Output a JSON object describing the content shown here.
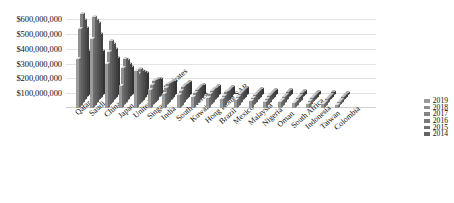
{
  "chart_data": {
    "type": "bar",
    "title": "",
    "subtitle": "",
    "xlabel": "",
    "ylabel": "",
    "grid": true,
    "legend_position": "right",
    "ylim": [
      0,
      650000000
    ],
    "ytick_labels": [
      "$600,000,000",
      "$500,000,000",
      "$400,000,000",
      "$300,000,000",
      "$200,000,000",
      "$100,000,000"
    ],
    "ytick_values": [
      600000000,
      500000000,
      400000000,
      300000000,
      200000000,
      100000000
    ],
    "categories": [
      "Qatar",
      "Saudi Arabia",
      "China",
      "Japan",
      "United Arab Emirates",
      "Singapore",
      "India",
      "South Korea",
      "Kuwait",
      "Hong Kong SAR",
      "Brazil",
      "Mexico",
      "Malaysia",
      "Nigeria",
      "Oman",
      "South Africa",
      "Indonesia",
      "Taiwan",
      "Colombia"
    ],
    "series": [
      {
        "name": "2019",
        "color": "#9a9a9a",
        "values": [
          330000000,
          470000000,
          300000000,
          150000000,
          250000000,
          120000000,
          95000000,
          90000000,
          75000000,
          70000000,
          62000000,
          55000000,
          48000000,
          42000000,
          38000000,
          32000000,
          28000000,
          24000000,
          20000000
        ]
      },
      {
        "name": "2018",
        "color": "#8f8f8f",
        "values": [
          520000000,
          600000000,
          360000000,
          250000000,
          210000000,
          135000000,
          115000000,
          100000000,
          82000000,
          76000000,
          66000000,
          58000000,
          50000000,
          44000000,
          39000000,
          33000000,
          29000000,
          25000000,
          21000000
        ]
      },
      {
        "name": "2017",
        "color": "#848484",
        "values": [
          600000000,
          560000000,
          420000000,
          300000000,
          230000000,
          150000000,
          128000000,
          108000000,
          88000000,
          80000000,
          70000000,
          60000000,
          52000000,
          46000000,
          40000000,
          34000000,
          30000000,
          26000000,
          22000000
        ]
      },
      {
        "name": "2016",
        "color": "#797979",
        "values": [
          540000000,
          520000000,
          380000000,
          270000000,
          200000000,
          140000000,
          118000000,
          102000000,
          84000000,
          74000000,
          64000000,
          56000000,
          49000000,
          43000000,
          37000000,
          31000000,
          27000000,
          23000000,
          19000000
        ]
      },
      {
        "name": "2015",
        "color": "#6e6e6e",
        "values": [
          470000000,
          430000000,
          330000000,
          225000000,
          175000000,
          125000000,
          105000000,
          94000000,
          78000000,
          68000000,
          60000000,
          52000000,
          45000000,
          40000000,
          35000000,
          29000000,
          25000000,
          21000000,
          18000000
        ]
      },
      {
        "name": "2014",
        "color": "#636363",
        "values": [
          300000000,
          300000000,
          250000000,
          190000000,
          150000000,
          110000000,
          92000000,
          86000000,
          70000000,
          62000000,
          55000000,
          48000000,
          42000000,
          37000000,
          32000000,
          27000000,
          23000000,
          20000000,
          16000000
        ]
      }
    ],
    "legend_entries": [
      "2019",
      "2018",
      "2017",
      "2016",
      "2015",
      "2014"
    ]
  },
  "colors": {
    "background": "#ffffff",
    "gridline": "#e3e3e3",
    "bar_front": "#8a8a8a",
    "bar_top": "#b4b4b4",
    "bar_side": "#6d6d6d",
    "text": "#111111"
  }
}
